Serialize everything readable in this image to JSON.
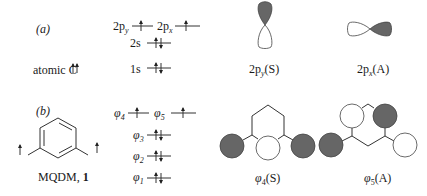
{
  "panel_a": {
    "label": "(a)",
    "atom_label": "atomic C",
    "atom_spin": "↑↑",
    "levels": [
      {
        "name": "2p",
        "sub": "y",
        "electrons": "↑"
      },
      {
        "name": "2p",
        "sub": "x",
        "electrons": "↑"
      },
      {
        "name": "2s",
        "sub": "",
        "electrons": "↑↓"
      },
      {
        "name": "1s",
        "sub": "",
        "electrons": "↑↓"
      }
    ],
    "orbitals": [
      {
        "label_main": "2p",
        "label_sub": "y",
        "label_sym": "(S)",
        "shaded_lobe": "top"
      },
      {
        "label_main": "2p",
        "label_sub": "x",
        "label_sym": "(A)",
        "shaded_lobe": "right"
      }
    ]
  },
  "panel_b": {
    "label": "(b)",
    "molecule_label": "MQDM, ",
    "molecule_number": "1",
    "levels": [
      {
        "name": "φ",
        "sub": "4",
        "electrons": "↑"
      },
      {
        "name": "φ",
        "sub": "5",
        "electrons": "↑"
      },
      {
        "name": "φ",
        "sub": "3",
        "electrons": "↑↓"
      },
      {
        "name": "φ",
        "sub": "2",
        "electrons": "↑↓"
      },
      {
        "name": "φ",
        "sub": "1",
        "electrons": "↑↓"
      }
    ],
    "orbitals": [
      {
        "label_main": "φ",
        "label_sub": "4",
        "label_sym": "(S)"
      },
      {
        "label_main": "φ",
        "label_sub": "5",
        "label_sym": "(A)"
      }
    ]
  },
  "colors": {
    "shaded": "#666666",
    "line": "#333333"
  }
}
